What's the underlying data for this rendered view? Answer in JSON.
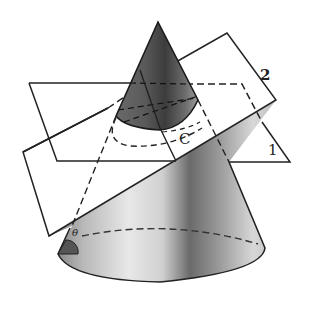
{
  "figure": {
    "labels": {
      "plane_2": "2",
      "plane_1": "1",
      "curve": "C",
      "angle": "θ"
    },
    "colors": {
      "line": "#222222",
      "cone_dark": "#3a3a3a",
      "cone_mid": "#8a8a8a",
      "cone_light": "#e6e6e6",
      "background": "#ffffff"
    }
  }
}
